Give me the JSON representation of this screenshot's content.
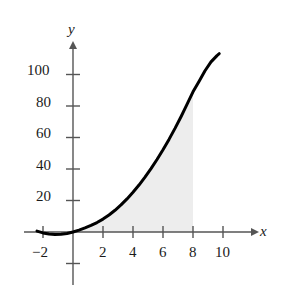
{
  "chart_data": {
    "type": "line",
    "title": "",
    "subtitle": "",
    "xlabel": "x",
    "ylabel": "y",
    "xlim": [
      -2.9,
      10.9
    ],
    "ylim": [
      -22,
      118
    ],
    "grid": false,
    "legend": null,
    "x_ticks": [
      {
        "value": -2,
        "label": "−2"
      },
      {
        "value": 2,
        "label": "2"
      },
      {
        "value": 4,
        "label": "4"
      },
      {
        "value": 6,
        "label": "6"
      },
      {
        "value": 8,
        "label": "8"
      },
      {
        "value": 10,
        "label": "10"
      }
    ],
    "y_ticks": [
      {
        "value": 20,
        "label": "20"
      },
      {
        "value": 40,
        "label": "40"
      },
      {
        "value": 60,
        "label": "60"
      },
      {
        "value": 80,
        "label": "80"
      },
      {
        "value": 100,
        "label": "100"
      }
    ],
    "y_unlabeled_ticks": [
      -20
    ],
    "series": [
      {
        "name": "curve",
        "color": "#000000",
        "linewidth": 3,
        "x": [
          -2.4,
          -2.0,
          -1.6,
          -1.2,
          -0.8,
          -0.4,
          0.0,
          0.4,
          0.8,
          1.2,
          1.6,
          2.0,
          2.4,
          2.8,
          3.2,
          3.6,
          4.0,
          4.4,
          4.8,
          5.2,
          5.6,
          6.0,
          6.4,
          6.8,
          7.2,
          7.6,
          8.0,
          8.4,
          8.8,
          9.2,
          9.6,
          9.75
        ],
        "y": [
          0.6,
          -0.6,
          -1.3,
          -1.6,
          -1.5,
          -1.0,
          0.0,
          1.2,
          2.6,
          4.2,
          6.0,
          8.2,
          10.8,
          13.8,
          17.2,
          21.0,
          25.2,
          29.8,
          34.8,
          40.2,
          46.0,
          52.2,
          58.8,
          65.8,
          73.2,
          81.0,
          89.0,
          95.6,
          102.4,
          108.0,
          112.0,
          113.2
        ]
      }
    ],
    "shaded_region": {
      "fill_color": "#ededed",
      "x_start": 0,
      "x_end": 8,
      "bounded_above_by": "curve",
      "bounded_below_by": "x-axis",
      "description": "Region under the curve from x = 0 to x = 8"
    },
    "axis_color": "#555555",
    "background_color": "#ffffff"
  }
}
